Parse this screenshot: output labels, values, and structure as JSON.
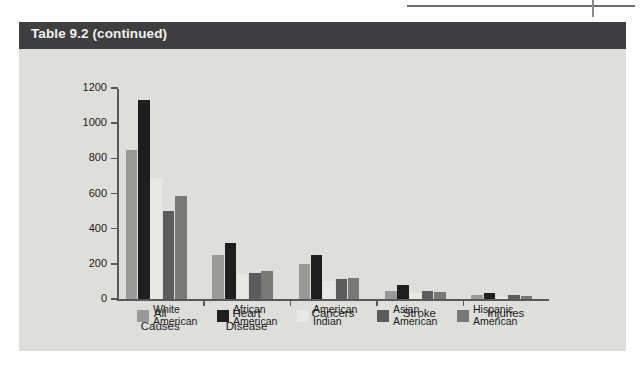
{
  "card": {
    "title": "Table 9.2 (continued)",
    "title_bar_color": "#3e3e40",
    "background_color": "#dededa"
  },
  "chart_data": {
    "type": "bar",
    "title": "",
    "xlabel": "",
    "ylabel": "",
    "ylim": [
      0,
      1200
    ],
    "ytick_values": [
      0,
      200,
      400,
      600,
      800,
      1000,
      1200
    ],
    "ytick_labels": [
      "0",
      "200",
      "400",
      "600",
      "800",
      "1000",
      "1200"
    ],
    "grid": false,
    "legend_position": "bottom",
    "categories": [
      "All\nCauses",
      "Heart\nDisease",
      "Cancers",
      "Stroke",
      "Injuries"
    ],
    "series": [
      {
        "name": "White\nAmerican",
        "legend_label": "White American",
        "color": "#9a9a98",
        "values": [
          850,
          250,
          200,
          45,
          25
        ]
      },
      {
        "name": "African\nAmerican",
        "legend_label": "African American",
        "color": "#1e1e1e",
        "values": [
          1130,
          320,
          250,
          80,
          35
        ]
      },
      {
        "name": "American\nIndian",
        "legend_label": "American Indian",
        "color": "#e8e8e4",
        "values": [
          690,
          140,
          105,
          35,
          10
        ]
      },
      {
        "name": "Asian\nAmerican",
        "legend_label": "Asian American",
        "color": "#5c5c5c",
        "values": [
          500,
          150,
          115,
          45,
          20
        ]
      },
      {
        "name": "Hispanic\nAmerican",
        "legend_label": "Hispanic American",
        "color": "#787876",
        "values": [
          585,
          160,
          120,
          40,
          18
        ]
      }
    ]
  }
}
